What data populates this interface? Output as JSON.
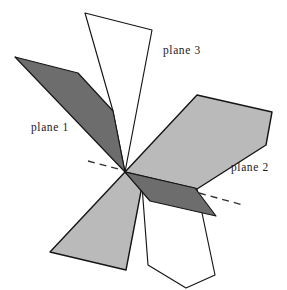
{
  "figure": {
    "background_color": "#ffffff",
    "width": 287,
    "height": 290,
    "colors": {
      "dark_gray_fill": "#6d6d6d",
      "light_gray_fill": "#bababa",
      "white_fill": "#ffffff",
      "outline": "#151515",
      "label_text": "#1a1a1a",
      "dashed_line": "#303030"
    },
    "intersection_point": {
      "x": 125,
      "y": 172
    },
    "labels": [
      {
        "id": "plane-1",
        "text": "plane 1",
        "x": 31,
        "y": 131
      },
      {
        "id": "plane-2",
        "text": "plane 2",
        "x": 231,
        "y": 171
      },
      {
        "id": "plane-3",
        "text": "plane 3",
        "x": 163,
        "y": 54
      }
    ],
    "planes": [
      {
        "id": "plane-1",
        "label": "plane 1",
        "shade": "dark",
        "description": "dark gray plane running from upper-left to lower-right through the intersection point",
        "faces": [
          {
            "id": "plane-1-upper-left-face",
            "fill": "#6d6d6d",
            "points": "15,57 78,73 113,111 125,172"
          },
          {
            "id": "plane-1-lower-right-face",
            "fill": "#6d6d6d",
            "points": "125,172 195,188 216,216 150,201"
          }
        ]
      },
      {
        "id": "plane-2",
        "label": "plane 2",
        "shade": "light",
        "description": "light gray plane running from upper-right to lower-left through the intersection point",
        "faces": [
          {
            "id": "plane-2-upper-right-face",
            "fill": "#bababa",
            "points": "197,95 272,112 266,145 197,189 125,172"
          },
          {
            "id": "plane-2-lower-left-face",
            "fill": "#bababa",
            "points": "125,172 142,186 126,270 50,252"
          }
        ]
      },
      {
        "id": "plane-3",
        "label": "plane 3",
        "shade": "white",
        "description": "white (unshaded) near-vertical plane passing through the intersection point",
        "faces": [
          {
            "id": "plane-3-upper-face",
            "fill": "#ffffff",
            "points": "85,13 152,30 125,172 113,111"
          },
          {
            "id": "plane-3-lower-face",
            "fill": "#ffffff",
            "points": "125,172 142,186 148,265 186,288 215,275 197,189"
          }
        ]
      }
    ],
    "dashed_lines": [
      {
        "id": "dashed-line-left",
        "x1": 88,
        "y1": 161,
        "x2": 118,
        "y2": 169
      },
      {
        "id": "dashed-line-right",
        "x1": 199,
        "y1": 193,
        "x2": 243,
        "y2": 205
      }
    ]
  }
}
